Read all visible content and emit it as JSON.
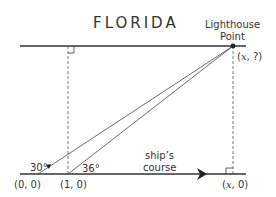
{
  "title": "FLORIDA",
  "lighthouse": {
    "line1": "Lighthouse",
    "line2": "Point",
    "coord_x": "x",
    "coord_rest": ", ?)"
  },
  "angles": {
    "a1": "30°",
    "a2": "36°"
  },
  "points": {
    "origin": "(0, 0)",
    "p1": "(1, 0)",
    "px_x": "x",
    "px_rest": ", 0)"
  },
  "course": {
    "line1": "ship’s",
    "line2": "course"
  }
}
